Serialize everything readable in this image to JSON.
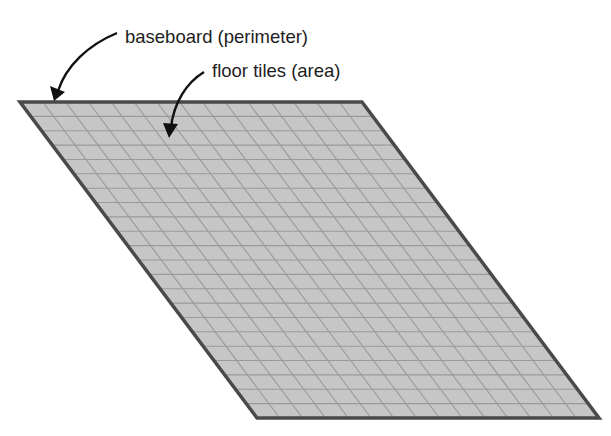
{
  "diagram": {
    "labels": {
      "perimeter": "baseboard (perimeter)",
      "area": "floor tiles (area)"
    },
    "shape": {
      "type": "parallelogram",
      "corners": {
        "top_left": [
          20,
          102
        ],
        "top_right": [
          362,
          102
        ],
        "bottom_right": [
          599,
          418
        ],
        "bottom_left": [
          257,
          418
        ]
      },
      "rows": 22,
      "columns": 15
    },
    "colors": {
      "fill": "#c6c6c6",
      "grid": "#9a9a9a",
      "border": "#4a4a4a",
      "arrow": "#111111",
      "text": "#1e1e1e"
    }
  }
}
